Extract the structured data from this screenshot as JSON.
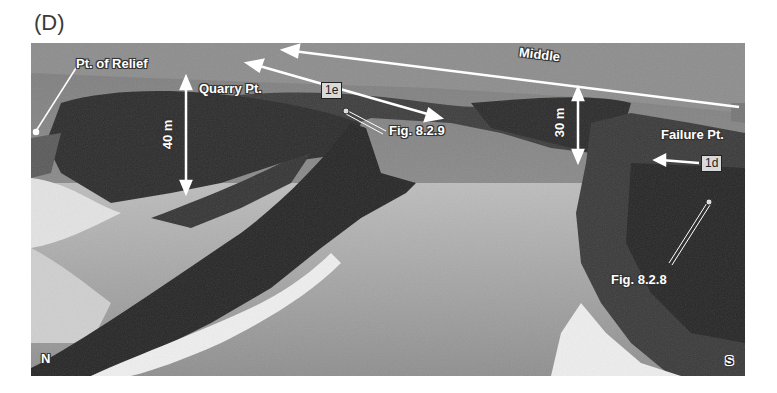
{
  "figure": {
    "panel_label": "(D)",
    "labels": {
      "pt_of_relief": "Pt. of Relief",
      "quarry_pt": "Quarry Pt.",
      "middle": "Middle",
      "failure_pt": "Failure Pt.",
      "fig_829": "Fig. 8.2.9",
      "fig_828": "Fig. 8.2.8",
      "height_40": "40 m",
      "height_30": "30 m",
      "box_1e": "1e",
      "box_1d": "1d",
      "north": "N",
      "south": "S"
    },
    "colors": {
      "sky": "#9a9a9a",
      "cliff_dark": "#2e2e2e",
      "water": "#a8a8a8",
      "surf": "#efefef",
      "annotation": "#ffffff"
    }
  }
}
